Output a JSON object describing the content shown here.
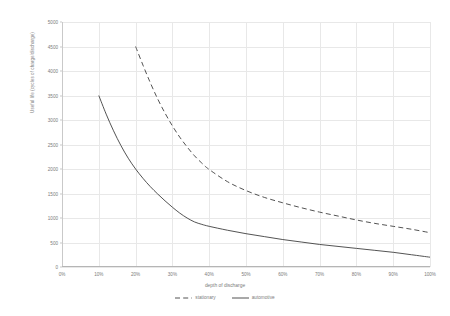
{
  "chart_data": {
    "type": "line",
    "title": "",
    "xlabel": "depth of discharge",
    "ylabel": "Useful life (cycles of charge/discharge)",
    "xlim": [
      0,
      100
    ],
    "ylim": [
      0,
      5000
    ],
    "xticks": [
      "0%",
      "10%",
      "20%",
      "30%",
      "40%",
      "50%",
      "60%",
      "70%",
      "80%",
      "90%",
      "100%"
    ],
    "xtick_values": [
      0,
      10,
      20,
      30,
      40,
      50,
      60,
      70,
      80,
      90,
      100
    ],
    "yticks": [
      "0",
      "500",
      "1000",
      "1500",
      "2000",
      "2500",
      "3000",
      "3500",
      "4000",
      "4500",
      "5000"
    ],
    "ytick_values": [
      0,
      500,
      1000,
      1500,
      2000,
      2500,
      3000,
      3500,
      4000,
      4500,
      5000
    ],
    "grid": true,
    "legend_position": "bottom",
    "series": [
      {
        "name": "stationary",
        "style": "dashed",
        "color": "#404040",
        "x": [
          20,
          22,
          24,
          26,
          28,
          30,
          32,
          34,
          36,
          38,
          40,
          45,
          50,
          55,
          60,
          65,
          70,
          75,
          80,
          85,
          90,
          95,
          100
        ],
        "values": [
          4500,
          4120,
          3760,
          3430,
          3140,
          2880,
          2650,
          2450,
          2270,
          2120,
          1990,
          1740,
          1560,
          1420,
          1310,
          1210,
          1120,
          1040,
          960,
          890,
          830,
          770,
          700
        ]
      },
      {
        "name": "automotive",
        "style": "solid",
        "color": "#404040",
        "x": [
          10,
          12,
          14,
          16,
          18,
          20,
          22,
          24,
          26,
          28,
          30,
          32,
          34,
          36,
          38,
          40,
          45,
          50,
          55,
          60,
          65,
          70,
          75,
          80,
          85,
          90,
          95,
          100
        ],
        "values": [
          3500,
          3120,
          2780,
          2480,
          2220,
          2000,
          1810,
          1640,
          1490,
          1350,
          1220,
          1100,
          1000,
          920,
          870,
          830,
          750,
          680,
          620,
          560,
          510,
          460,
          420,
          380,
          340,
          300,
          250,
          200
        ]
      }
    ]
  },
  "legend": {
    "items": [
      {
        "label": "stationary",
        "style": "dashed"
      },
      {
        "label": "automotive",
        "style": "solid"
      }
    ]
  }
}
